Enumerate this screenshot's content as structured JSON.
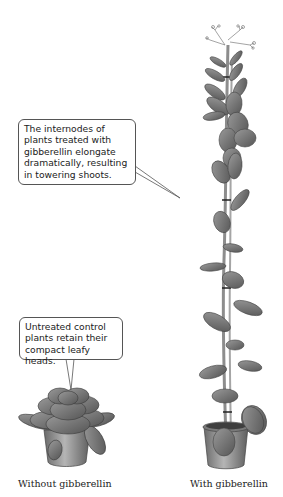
{
  "figure": {
    "callouts": [
      {
        "id": "top",
        "text": "The internodes of plants treated with gibberellin elongate dramatically, resulting in towering shoots."
      },
      {
        "id": "bottom",
        "text": "Untreated control plants retain their compact leafy heads."
      }
    ],
    "captions": {
      "left": "Without gibberellin",
      "right": "With gibberellin"
    },
    "colors": {
      "leaf": "#7a7a7a",
      "leaf_dark": "#4f4f4f",
      "pot": "#8a8a8a",
      "stem": "#9a9a9a",
      "outline": "#444444"
    }
  }
}
